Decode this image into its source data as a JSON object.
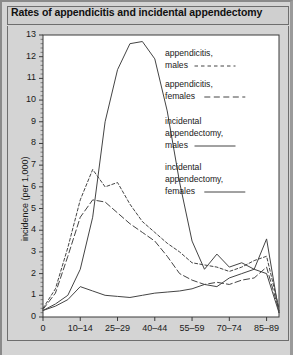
{
  "title": "Rates of appendicitis and incidental appendectomy",
  "source_note": "",
  "axes": {
    "ylabel": "incidence (per 1,000)",
    "xlabel": "age group (years)",
    "yticks": [
      "0",
      "1",
      "2",
      "3",
      "4",
      "5",
      "6",
      "7",
      "8",
      "9",
      "10",
      "11",
      "12",
      "13"
    ],
    "xticks": [
      "0",
      "10–14",
      "25–29",
      "40–44",
      "55–59",
      "70–74",
      "85–89"
    ]
  },
  "legend": {
    "entries": [
      {
        "label_line1": "appendicitis,",
        "label_line2": "males",
        "style": "short-dash"
      },
      {
        "label_line1": "appendicitis,",
        "label_line2": "females",
        "style": "long-dash"
      },
      {
        "label_line1": "incidental",
        "label_line2": "appendectomy,",
        "label_line3": "males",
        "style": "solid"
      },
      {
        "label_line1": "incidental",
        "label_line2": "appendectomy,",
        "label_line3": "females",
        "style": "solid"
      }
    ]
  },
  "chart_data": {
    "type": "line",
    "title": "Rates of appendicitis and incidental appendectomy",
    "xlabel": "age group (years)",
    "ylabel": "incidence (per 1,000)",
    "ylim": [
      0,
      13
    ],
    "grid": false,
    "legend_position": "right",
    "categories": [
      "0",
      "1-4",
      "5-9",
      "10-14",
      "15-19",
      "20-24",
      "25-29",
      "30-34",
      "35-39",
      "40-44",
      "45-49",
      "50-54",
      "55-59",
      "60-64",
      "65-69",
      "70-74",
      "75-79",
      "80-84",
      "85-89",
      "90+"
    ],
    "series": [
      {
        "name": "appendicitis, males",
        "style": "short-dash",
        "values": [
          0.4,
          1.3,
          3.2,
          5.4,
          6.8,
          6.0,
          6.2,
          5.2,
          4.4,
          3.9,
          3.4,
          3.0,
          2.5,
          2.4,
          2.3,
          2.1,
          2.3,
          2.6,
          2.8,
          0.4
        ]
      },
      {
        "name": "appendicitis, females",
        "style": "long-dash",
        "values": [
          0.35,
          1.1,
          2.8,
          4.6,
          5.4,
          5.3,
          4.8,
          4.3,
          3.9,
          3.5,
          2.8,
          2.0,
          1.7,
          1.5,
          1.6,
          1.5,
          1.7,
          1.8,
          2.3,
          0.3
        ]
      },
      {
        "name": "incidental appendectomy, males",
        "style": "solid",
        "values": [
          0.3,
          0.5,
          0.8,
          1.4,
          1.2,
          1.0,
          0.95,
          0.9,
          1.0,
          1.1,
          1.15,
          1.2,
          1.3,
          1.5,
          1.4,
          1.8,
          2.0,
          2.2,
          2.0,
          0.2
        ]
      },
      {
        "name": "incidental appendectomy, females",
        "style": "solid",
        "values": [
          0.3,
          0.6,
          1.0,
          2.2,
          4.6,
          9.0,
          11.4,
          12.6,
          12.7,
          11.9,
          9.5,
          6.2,
          3.5,
          2.2,
          2.9,
          2.3,
          2.5,
          2.2,
          3.6,
          0.2
        ]
      }
    ]
  }
}
